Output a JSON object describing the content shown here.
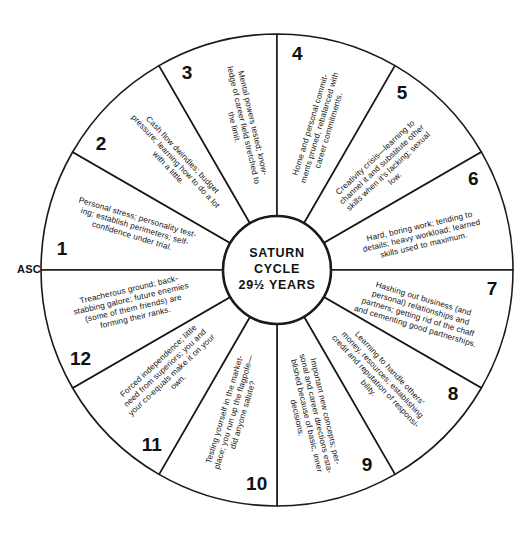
{
  "diagram": {
    "title_lines": [
      "SATURN",
      "CYCLE",
      "29½ YEARS"
    ],
    "asc_label": "ASC",
    "geometry": {
      "cx": 277,
      "cy": 270,
      "outer_radius": 236,
      "inner_radius": 54,
      "sector_count": 12,
      "start_angle_deg": 180,
      "direction": "counterclockwise"
    },
    "sectors": [
      {
        "number": "1",
        "lines": [
          "Personal stress; personality test-",
          "ing; establish perimeters; self-",
          "confidence under trial."
        ]
      },
      {
        "number": "2",
        "lines": [
          "Cash flow dwindles; budget",
          "pressure; learning how to do a lot",
          "with a little."
        ]
      },
      {
        "number": "3",
        "lines": [
          "Mental powers tested; know-",
          "ledge of career field stretched to",
          "the limit."
        ]
      },
      {
        "number": "4",
        "lines": [
          "Home and personal commit-",
          "ments pruned, rebalanced with",
          "career commitments."
        ]
      },
      {
        "number": "5",
        "lines": [
          "Creativity crisis—learning to",
          "channel it and substitute other",
          "skills when it's lacking; sexual",
          "low."
        ]
      },
      {
        "number": "6",
        "lines": [
          "Hard, boring work; tending to",
          "details; heavy workload; learned",
          "skills used to maximum."
        ]
      },
      {
        "number": "7",
        "lines": [
          "Hashing out business (and",
          "personal) relationships and",
          "partners; getting rid of the chaff",
          "and cementing good partnerships."
        ]
      },
      {
        "number": "8",
        "lines": [
          "Learning to handle others'",
          "money, resources; establishing",
          "credit and reputation of responsi-",
          "bility."
        ]
      },
      {
        "number": "9",
        "lines": [
          "Important new concepts; per-",
          "sonal and career directions esta-",
          "blished because of basic, inner",
          "decisions."
        ]
      },
      {
        "number": "10",
        "lines": [
          "Testing yourself in the market-",
          "place; you run up the flagpole—",
          "did anyone salute?"
        ]
      },
      {
        "number": "11",
        "lines": [
          "Forced independence; little",
          "need from superiors; you and",
          "your co-equals make it on your",
          "own."
        ]
      },
      {
        "number": "12",
        "lines": [
          "Treacherous ground; back-",
          "stabbing galore; future enemies",
          "(some of them friends) are",
          "forming their ranks."
        ]
      }
    ],
    "colors": {
      "stroke": "#1a1a1a",
      "background": "#ffffff",
      "text": "#111111"
    }
  }
}
